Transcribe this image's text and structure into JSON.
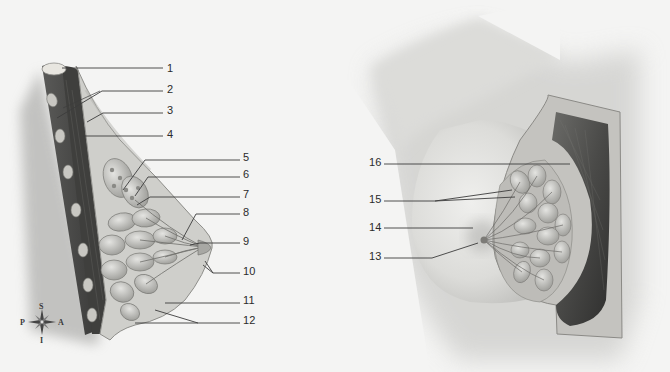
{
  "figure": {
    "left_view": {
      "description": "sagittal section",
      "labels": [
        {
          "id": "1",
          "text": "1"
        },
        {
          "id": "2",
          "text": "2"
        },
        {
          "id": "3",
          "text": "3"
        },
        {
          "id": "4",
          "text": "4"
        },
        {
          "id": "5",
          "text": "5"
        },
        {
          "id": "6",
          "text": "6"
        },
        {
          "id": "7",
          "text": "7"
        },
        {
          "id": "8",
          "text": "8"
        },
        {
          "id": "9",
          "text": "9"
        },
        {
          "id": "10",
          "text": "10"
        },
        {
          "id": "11",
          "text": "11"
        },
        {
          "id": "12",
          "text": "12"
        }
      ]
    },
    "right_view": {
      "description": "anterior cutaway view",
      "labels": [
        {
          "id": "13",
          "text": "13"
        },
        {
          "id": "14",
          "text": "14"
        },
        {
          "id": "15",
          "text": "15"
        },
        {
          "id": "16",
          "text": "16"
        }
      ]
    },
    "compass": {
      "superior": "S",
      "inferior": "I",
      "posterior": "P",
      "anterior": "A"
    }
  },
  "colors": {
    "background": "#f4f4f3",
    "leader_line": "#3c3c3c",
    "label_text": "#2b2b2b",
    "skin": "#d9d9d6",
    "muscle_dark": "#4a4a48",
    "gland": "#b8b8b4"
  }
}
